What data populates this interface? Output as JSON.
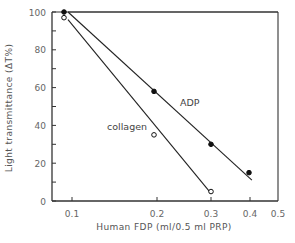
{
  "chart_data": {
    "type": "line",
    "title": "",
    "xlabel": "Human FDP (ml/0.5 ml PRP)",
    "ylabel": "Light transmittance (ΔT%)",
    "xscale": "log",
    "xlim": [
      0.09,
      0.5
    ],
    "ylim": [
      0,
      100
    ],
    "x_ticks": [
      0.1,
      0.2,
      0.3,
      0.4,
      0.5
    ],
    "x_tick_labels": [
      "0.1",
      "0.2",
      "0.3",
      "0.4",
      "0.5"
    ],
    "y_ticks": [
      0,
      20,
      40,
      60,
      80,
      100
    ],
    "y_tick_labels": [
      "0",
      "20",
      "40",
      "60",
      "80",
      "100"
    ],
    "grid": false,
    "legend": "inline labels",
    "series": [
      {
        "name": "ADP",
        "marker": "filled-circle",
        "x": [
          0.1,
          0.2,
          0.3,
          0.4
        ],
        "values": [
          100,
          58,
          30,
          15
        ],
        "fit_line": {
          "from": [
            0.1,
            100
          ],
          "to": [
            0.41,
            11
          ]
        }
      },
      {
        "name": "collagen",
        "marker": "open-circle",
        "x": [
          0.1,
          0.2,
          0.3
        ],
        "values": [
          97,
          35,
          5
        ],
        "fit_line": {
          "from": [
            0.1,
            96
          ],
          "to": [
            0.3,
            4
          ]
        }
      }
    ]
  },
  "labels": {
    "xlabel": "Human FDP (ml/0.5 ml PRP)",
    "ylabel": "Light transmittance (ΔT%)",
    "adp": "ADP",
    "collagen": "collagen"
  }
}
